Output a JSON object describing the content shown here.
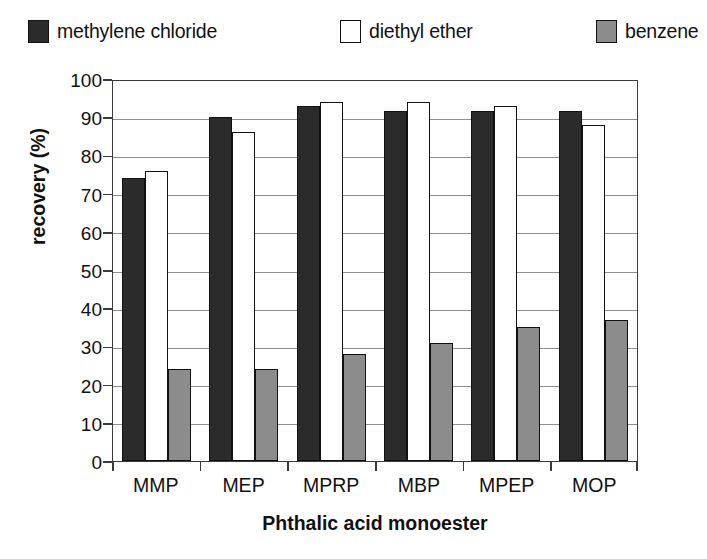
{
  "chart_data": {
    "type": "bar",
    "title": "",
    "xlabel": "Phthalic acid monoester",
    "ylabel": "recovery (%)",
    "ylim": [
      0,
      100
    ],
    "ytick_step": 10,
    "yticks": [
      0,
      10,
      20,
      30,
      40,
      50,
      60,
      70,
      80,
      90,
      100
    ],
    "grid": "horizontal",
    "legend_position": "top",
    "categories": [
      "MMP",
      "MEP",
      "MPRP",
      "MBP",
      "MPEP",
      "MOP"
    ],
    "series": [
      {
        "name": "methylene chloride",
        "color": "#2b2b2b",
        "values": [
          74,
          90,
          93,
          91.5,
          91.5,
          91.5
        ]
      },
      {
        "name": "diethyl ether",
        "color": "#ffffff",
        "values": [
          76,
          86,
          94,
          94,
          93,
          88
        ]
      },
      {
        "name": "benzene",
        "color": "#8c8c8c",
        "values": [
          24,
          24,
          28,
          31,
          35,
          37
        ]
      }
    ]
  },
  "legend": {
    "items": [
      {
        "label": "methylene chloride",
        "swatch": "legend-swatch-methylene-chloride"
      },
      {
        "label": "diethyl ether",
        "swatch": "legend-swatch-diethyl-ether"
      },
      {
        "label": "benzene",
        "swatch": "legend-swatch-benzene"
      }
    ]
  },
  "axes": {
    "y_title": "recovery (%)",
    "x_title": "Phthalic acid monoester"
  }
}
